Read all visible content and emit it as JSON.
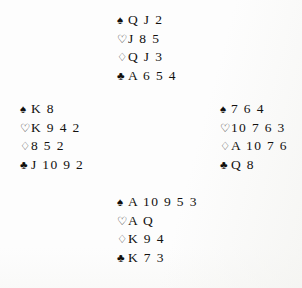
{
  "diagram": {
    "type": "bridge-hand-diagram",
    "layout": "compass-four-hands",
    "background_color": "#fdfdfd",
    "text_color": "#12110f"
  },
  "suits": {
    "spade": {
      "name": "spade-symbol",
      "glyph": "♠",
      "style": "solid"
    },
    "heart": {
      "name": "heart-symbol",
      "glyph": "♡",
      "style": "outline"
    },
    "diamond": {
      "name": "diamond-symbol",
      "glyph": "♢",
      "style": "outline"
    },
    "club": {
      "name": "club-symbol",
      "glyph": "♣",
      "style": "solid"
    }
  },
  "hands": {
    "north": {
      "position": "North",
      "spades": "Q J 2",
      "hearts": "J 8 5",
      "diamonds": "Q J 3",
      "clubs": "A 6 5 4"
    },
    "west": {
      "position": "West",
      "spades": "K 8",
      "hearts": "K 9 4 2",
      "diamonds": "8 5 2",
      "clubs": "J 10 9 2"
    },
    "east": {
      "position": "East",
      "spades": "7 6 4",
      "hearts": "10 7 6 3",
      "diamonds": "A 10 7 6",
      "clubs": "Q 8"
    },
    "south": {
      "position": "South",
      "spades": "A 10 9 5 3",
      "hearts": "A Q",
      "diamonds": "K 9 4",
      "clubs": "K 7 3"
    }
  }
}
